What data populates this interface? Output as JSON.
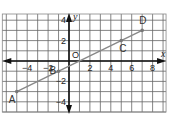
{
  "diagram": {
    "type": "coordinate_plane",
    "axes": {
      "x_label": "x",
      "y_label": "y",
      "origin_label": "O",
      "x_range": [
        -6,
        9
      ],
      "y_range": [
        -5,
        5
      ],
      "x_ticks": [
        {
          "value": -4,
          "label": "−4"
        },
        {
          "value": -2,
          "label": "−2"
        },
        {
          "value": 2,
          "label": "2"
        },
        {
          "value": 4,
          "label": "4"
        },
        {
          "value": 6,
          "label": "6"
        },
        {
          "value": 8,
          "label": "8"
        }
      ],
      "y_ticks": [
        {
          "value": 4,
          "label": "4"
        },
        {
          "value": 2,
          "label": "2"
        },
        {
          "value": -2,
          "label": "−2"
        },
        {
          "value": -4,
          "label": "−4"
        }
      ]
    },
    "grid": {
      "on": true,
      "step": 1,
      "color": "#555555"
    },
    "line": {
      "color": "#888888",
      "through": [
        "A",
        "D"
      ]
    },
    "points": [
      {
        "name": "A",
        "x": -5,
        "y": -3
      },
      {
        "name": "B",
        "x": -1,
        "y": -1
      },
      {
        "name": "C",
        "x": 5,
        "y": 2
      },
      {
        "name": "D",
        "x": 7,
        "y": 3
      }
    ]
  }
}
